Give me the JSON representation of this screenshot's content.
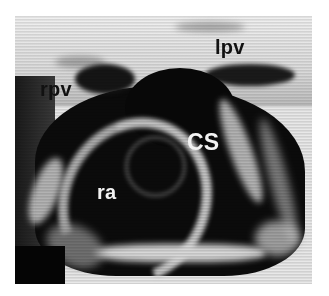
{
  "figure": {
    "type": "grayscale echocardiographic image",
    "labels": [
      {
        "id": "lpv",
        "text": "lpv",
        "meaning_color": "#111111"
      },
      {
        "id": "rpv",
        "text": "rpv",
        "meaning_color": "#111111"
      },
      {
        "id": "cs",
        "text": "CS",
        "meaning_color": "#f2f2f2"
      },
      {
        "id": "ra",
        "text": "ra",
        "meaning_color": "#f2f2f2"
      }
    ]
  },
  "colors": {
    "background": "#ffffff",
    "tissue_bright": "#e8e8e8",
    "cavity_dark": "#0a0a0a"
  }
}
